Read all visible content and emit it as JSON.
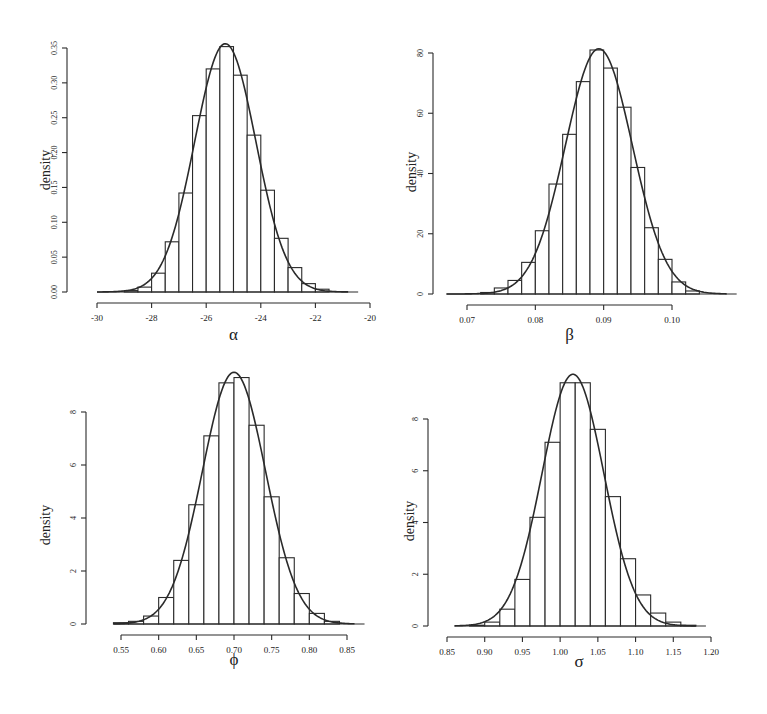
{
  "figure": {
    "panels": [
      {
        "id": "alpha",
        "xlabel": "α",
        "ylabel": "density"
      },
      {
        "id": "beta",
        "xlabel": "β",
        "ylabel": "density"
      },
      {
        "id": "phi",
        "xlabel": "ϕ",
        "ylabel": "density"
      },
      {
        "id": "sigma",
        "xlabel": "σ",
        "ylabel": "density"
      }
    ],
    "colors": {
      "line": "#2a2a2a",
      "bar_fill": "#ffffff",
      "background": "#ffffff"
    }
  },
  "chart_data": [
    {
      "type": "bar",
      "subtype": "histogram_with_density",
      "title": "",
      "xlabel": "α",
      "ylabel": "density",
      "xlim": [
        -30,
        -20
      ],
      "ylim": [
        0,
        0.35
      ],
      "xticks": [
        -30,
        -28,
        -26,
        -24,
        -22,
        -20
      ],
      "xtick_labels": [
        "-30",
        "-28",
        "-26",
        "-24",
        "-22",
        "-20"
      ],
      "yticks": [
        0.0,
        0.05,
        0.1,
        0.15,
        0.2,
        0.25,
        0.3,
        0.35
      ],
      "ytick_labels": [
        "0.00",
        "0.05",
        "0.10",
        "0.15",
        "0.20",
        "0.25",
        "0.30",
        "0.35"
      ],
      "bin_width": 0.5,
      "bin_edges": [
        -29,
        -28.5,
        -28,
        -27.5,
        -27,
        -26.5,
        -26,
        -25.5,
        -25,
        -24.5,
        -24,
        -23.5,
        -23,
        -22.5,
        -22,
        -21.5
      ],
      "values": [
        0.002,
        0.007,
        0.027,
        0.072,
        0.142,
        0.253,
        0.32,
        0.352,
        0.311,
        0.225,
        0.146,
        0.077,
        0.035,
        0.012,
        0.004
      ],
      "density_curve": {
        "mean": -25.3,
        "sd": 1.12,
        "range": [
          -30,
          -20.8
        ]
      },
      "grid": false
    },
    {
      "type": "bar",
      "subtype": "histogram_with_density",
      "title": "",
      "xlabel": "β",
      "ylabel": "density",
      "xlim": [
        0.07,
        0.1
      ],
      "ylim": [
        0,
        80
      ],
      "xticks": [
        0.07,
        0.08,
        0.09,
        0.1
      ],
      "xtick_labels": [
        "0.07",
        "0.08",
        "0.09",
        "0.10"
      ],
      "yticks": [
        0,
        20,
        40,
        60,
        80
      ],
      "ytick_labels": [
        "0",
        "20",
        "40",
        "60",
        "80"
      ],
      "bin_width": 0.002,
      "bin_edges": [
        0.072,
        0.074,
        0.076,
        0.078,
        0.08,
        0.082,
        0.084,
        0.086,
        0.088,
        0.09,
        0.092,
        0.094,
        0.096,
        0.098,
        0.1,
        0.102,
        0.104
      ],
      "values": [
        0.5,
        2,
        4.5,
        10.5,
        21,
        36.5,
        53,
        70.5,
        81,
        75,
        62,
        42,
        22,
        11.5,
        4,
        1
      ],
      "density_curve": {
        "mean": 0.0893,
        "sd": 0.0049,
        "range": [
          0.067,
          0.108
        ]
      },
      "grid": false
    },
    {
      "type": "bar",
      "subtype": "histogram_with_density",
      "title": "",
      "xlabel": "ϕ",
      "ylabel": "density",
      "xlim": [
        0.55,
        0.85
      ],
      "ylim": [
        0,
        8
      ],
      "xticks": [
        0.55,
        0.6,
        0.65,
        0.7,
        0.75,
        0.8,
        0.85
      ],
      "xtick_labels": [
        "0.55",
        "0.60",
        "0.65",
        "0.70",
        "0.75",
        "0.80",
        "0.85"
      ],
      "yticks": [
        0,
        2,
        4,
        6,
        8
      ],
      "ytick_labels": [
        "0",
        "2",
        "4",
        "6",
        "8"
      ],
      "bin_width": 0.02,
      "bin_edges": [
        0.54,
        0.56,
        0.58,
        0.6,
        0.62,
        0.64,
        0.66,
        0.68,
        0.7,
        0.72,
        0.74,
        0.76,
        0.78,
        0.8,
        0.82,
        0.84
      ],
      "values": [
        0.05,
        0.1,
        0.3,
        1.0,
        2.4,
        4.5,
        7.1,
        9.1,
        9.3,
        7.5,
        4.8,
        2.5,
        1.15,
        0.4,
        0.1
      ],
      "density_curve": {
        "mean": 0.7,
        "sd": 0.042,
        "range": [
          0.54,
          0.86
        ]
      },
      "grid": false
    },
    {
      "type": "bar",
      "subtype": "histogram_with_density",
      "title": "",
      "xlabel": "σ",
      "ylabel": "density",
      "xlim": [
        0.85,
        1.2
      ],
      "ylim": [
        0,
        8
      ],
      "xticks": [
        0.85,
        0.9,
        0.95,
        1.0,
        1.05,
        1.1,
        1.15,
        1.2
      ],
      "xtick_labels": [
        "0.85",
        "0.90",
        "0.95",
        "1.00",
        "1.05",
        "1.10",
        "1.15",
        "1.20"
      ],
      "yticks": [
        0,
        2,
        4,
        6,
        8
      ],
      "ytick_labels": [
        "0",
        "2",
        "4",
        "6",
        "8"
      ],
      "bin_width": 0.02,
      "bin_edges": [
        0.88,
        0.9,
        0.92,
        0.94,
        0.96,
        0.98,
        1.0,
        1.02,
        1.04,
        1.06,
        1.08,
        1.1,
        1.12,
        1.14,
        1.16,
        1.18
      ],
      "values": [
        0.03,
        0.15,
        0.65,
        1.8,
        4.2,
        7.1,
        9.4,
        9.4,
        7.6,
        5.0,
        2.6,
        1.2,
        0.5,
        0.15,
        0.03
      ],
      "density_curve": {
        "mean": 1.017,
        "sd": 0.041,
        "range": [
          0.86,
          1.18
        ]
      },
      "grid": false
    }
  ]
}
